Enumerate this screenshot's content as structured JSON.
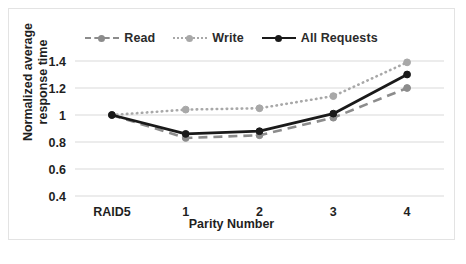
{
  "chart_data": {
    "type": "line",
    "title": "",
    "xlabel": "Parity Number",
    "ylabel": "Normalized average response time",
    "ylabel_line1": "Normalized average",
    "ylabel_line2": "response time",
    "categories": [
      "RAID5",
      "1",
      "2",
      "3",
      "4"
    ],
    "yticks": [
      "1.4",
      "1.2",
      "1",
      "0.8",
      "0.6",
      "0.4"
    ],
    "ytick_values": [
      1.4,
      1.2,
      1.0,
      0.8,
      0.6,
      0.4
    ],
    "ylim": [
      0.4,
      1.4
    ],
    "grid": true,
    "legend_position": "top",
    "series": [
      {
        "name": "Read",
        "values": [
          1.0,
          0.83,
          0.85,
          0.98,
          1.2
        ],
        "color": "#8c8c8c",
        "style": "dashed"
      },
      {
        "name": "Write",
        "values": [
          1.0,
          1.04,
          1.05,
          1.14,
          1.39
        ],
        "color": "#a8a8a8",
        "style": "dotted"
      },
      {
        "name": "All Requests",
        "values": [
          1.0,
          0.86,
          0.88,
          1.01,
          1.3
        ],
        "color": "#1a1a1a",
        "style": "solid"
      }
    ]
  },
  "legend": {
    "items": [
      {
        "label": "Read"
      },
      {
        "label": "Write"
      },
      {
        "label": "All Requests"
      }
    ]
  }
}
